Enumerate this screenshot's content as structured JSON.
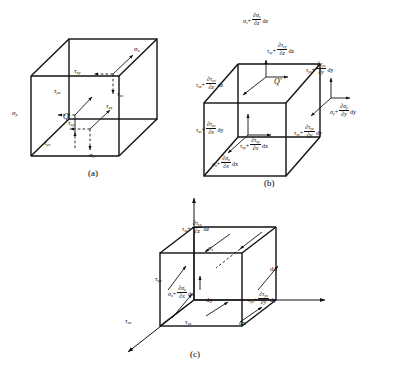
{
  "figure": {
    "background": "#ffffff",
    "stroke_color": "#111111",
    "panels": [
      {
        "id": "a",
        "caption": "(a)",
        "description": "Cube with stress components at point Q on the negative faces",
        "point_label": "Q",
        "labels": [
          {
            "name": "sigma-y",
            "text": "σ",
            "sub": "y"
          },
          {
            "name": "tau-yx",
            "text": "τ",
            "sub": "yx"
          },
          {
            "name": "tau-yz",
            "text": "τ",
            "sub": "yz"
          },
          {
            "name": "sigma-x",
            "text": "σ",
            "sub": "x"
          },
          {
            "name": "tau-xy",
            "text": "τ",
            "sub": "xy"
          },
          {
            "name": "tau-xz",
            "text": "τ",
            "sub": "xz"
          },
          {
            "name": "sigma-z",
            "text": "σ",
            "sub": "z"
          },
          {
            "name": "tau-zy",
            "text": "τ",
            "sub": "zy"
          },
          {
            "name": "tau-zx",
            "text": "τ",
            "sub": "zx"
          }
        ]
      },
      {
        "id": "b",
        "caption": "(b)",
        "description": "Cube with incremented stress components at point Q-prime on the positive faces",
        "point_label": "Q′",
        "labels": [
          {
            "name": "sigma-z-inc",
            "base": "σ",
            "base_sub": "z",
            "num": "∂σ",
            "num_sub": "z",
            "den": "∂z",
            "diff": "dz"
          },
          {
            "name": "tau-zy-inc",
            "base": "τ",
            "base_sub": "zy",
            "num": "∂τ",
            "num_sub": "zy",
            "den": "∂z",
            "diff": "dz"
          },
          {
            "name": "tau-zx-inc",
            "base": "τ",
            "base_sub": "zx",
            "num": "∂τ",
            "num_sub": "zx",
            "den": "∂z",
            "diff": "dz"
          },
          {
            "name": "tau-yz-inc",
            "base": "τ",
            "base_sub": "yz",
            "num": "∂τ",
            "num_sub": "yz",
            "den": "∂y",
            "diff": "dy"
          },
          {
            "name": "sigma-y-inc",
            "base": "σ",
            "base_sub": "y",
            "num": "∂σ",
            "num_sub": "y",
            "den": "∂y",
            "diff": "dy"
          },
          {
            "name": "tau-yx-inc",
            "base": "τ",
            "base_sub": "yx",
            "num": "∂τ",
            "num_sub": "yx",
            "den": "∂y",
            "diff": "dy"
          },
          {
            "name": "tau-xz-inc",
            "base": "τ",
            "base_sub": "xz",
            "num": "∂τ",
            "num_sub": "xz",
            "den": "∂x",
            "diff": "dy"
          },
          {
            "name": "tau-xy-inc",
            "base": "τ",
            "base_sub": "xy",
            "num": "∂τ",
            "num_sub": "xy",
            "den": "∂x",
            "diff": "dx"
          },
          {
            "name": "sigma-x-inc",
            "base": "σ",
            "base_sub": "x",
            "num": "∂σ",
            "num_sub": "x",
            "den": "∂x",
            "diff": "dx"
          }
        ]
      },
      {
        "id": "c",
        "caption": "(c)",
        "description": "Cube with combined stress components and edge dimensions dx, dy, dz",
        "labels": [
          {
            "name": "tau-zx-inc",
            "base": "τ",
            "base_sub": "zx",
            "num": "∂τ",
            "num_sub": "zx",
            "den": "∂z",
            "diff": "dz"
          },
          {
            "name": "sigma-z",
            "text": "σ",
            "sub": "z"
          },
          {
            "name": "tau-yx",
            "text": "τ",
            "sub": "yx"
          },
          {
            "name": "sigma-x-inc",
            "base": "σ",
            "base_sub": "x",
            "num": "∂σ",
            "num_sub": "x",
            "den": "∂x",
            "diff": "dx"
          },
          {
            "name": "tau-yx-inc",
            "base": "τ",
            "base_sub": "yx",
            "num": "∂τ",
            "num_sub": "yx",
            "den": "∂y",
            "diff": "dy"
          },
          {
            "name": "tau-zx",
            "text": "τ",
            "sub": "zx"
          },
          {
            "name": "tau-zx-left",
            "text": "τ",
            "sub": "zx"
          },
          {
            "name": "dim-dz",
            "text": "dz"
          },
          {
            "name": "dim-dy",
            "text": "dy"
          },
          {
            "name": "dim-dx",
            "text": "dx"
          }
        ]
      }
    ],
    "dimensions": {
      "dx": "dx",
      "dy": "dy",
      "dz": "dz"
    },
    "partials": {
      "px": "∂x",
      "py": "∂y",
      "pz": "∂z"
    }
  }
}
